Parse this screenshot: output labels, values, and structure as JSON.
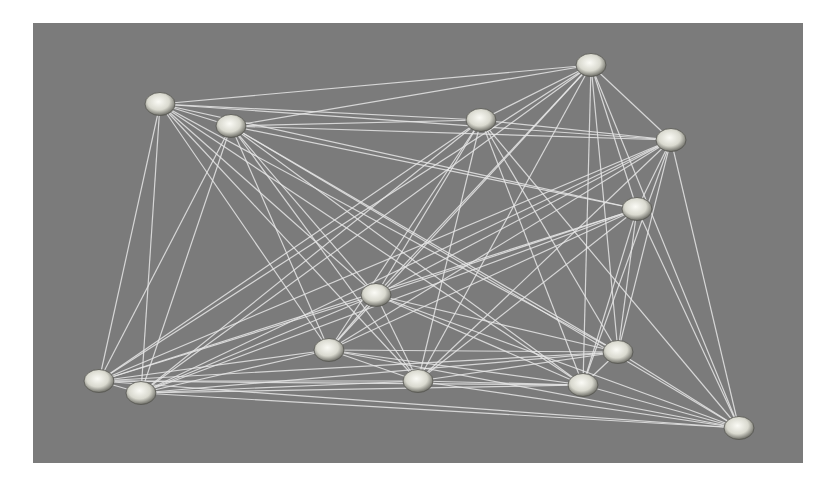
{
  "graph": {
    "type": "network",
    "background_color": "#7b7b7b",
    "edge_color": "#e6e6e6",
    "node_color": "#e8e8e0",
    "nodes": [
      {
        "id": "A",
        "x": 160,
        "y": 104
      },
      {
        "id": "B",
        "x": 231,
        "y": 126
      },
      {
        "id": "C",
        "x": 481,
        "y": 120
      },
      {
        "id": "D",
        "x": 591,
        "y": 65
      },
      {
        "id": "E",
        "x": 671,
        "y": 140
      },
      {
        "id": "F",
        "x": 637,
        "y": 209
      },
      {
        "id": "G",
        "x": 376,
        "y": 295
      },
      {
        "id": "H",
        "x": 329,
        "y": 350
      },
      {
        "id": "I",
        "x": 99,
        "y": 381
      },
      {
        "id": "J",
        "x": 141,
        "y": 393
      },
      {
        "id": "K",
        "x": 418,
        "y": 381
      },
      {
        "id": "L",
        "x": 583,
        "y": 385
      },
      {
        "id": "M",
        "x": 618,
        "y": 352
      },
      {
        "id": "N",
        "x": 739,
        "y": 428
      }
    ],
    "edges": [
      [
        "A",
        "B"
      ],
      [
        "A",
        "C"
      ],
      [
        "A",
        "D"
      ],
      [
        "A",
        "E"
      ],
      [
        "A",
        "F"
      ],
      [
        "A",
        "G"
      ],
      [
        "A",
        "H"
      ],
      [
        "A",
        "I"
      ],
      [
        "A",
        "J"
      ],
      [
        "A",
        "K"
      ],
      [
        "A",
        "L"
      ],
      [
        "A",
        "M"
      ],
      [
        "B",
        "C"
      ],
      [
        "B",
        "D"
      ],
      [
        "B",
        "E"
      ],
      [
        "B",
        "F"
      ],
      [
        "B",
        "G"
      ],
      [
        "B",
        "H"
      ],
      [
        "B",
        "I"
      ],
      [
        "B",
        "J"
      ],
      [
        "B",
        "K"
      ],
      [
        "B",
        "L"
      ],
      [
        "B",
        "M"
      ],
      [
        "B",
        "N"
      ],
      [
        "C",
        "D"
      ],
      [
        "C",
        "E"
      ],
      [
        "C",
        "G"
      ],
      [
        "C",
        "H"
      ],
      [
        "C",
        "I"
      ],
      [
        "C",
        "J"
      ],
      [
        "C",
        "K"
      ],
      [
        "C",
        "L"
      ],
      [
        "C",
        "M"
      ],
      [
        "C",
        "N"
      ],
      [
        "D",
        "E"
      ],
      [
        "D",
        "F"
      ],
      [
        "D",
        "G"
      ],
      [
        "D",
        "H"
      ],
      [
        "D",
        "I"
      ],
      [
        "D",
        "J"
      ],
      [
        "D",
        "K"
      ],
      [
        "D",
        "L"
      ],
      [
        "D",
        "M"
      ],
      [
        "D",
        "N"
      ],
      [
        "E",
        "F"
      ],
      [
        "E",
        "G"
      ],
      [
        "E",
        "H"
      ],
      [
        "E",
        "I"
      ],
      [
        "E",
        "J"
      ],
      [
        "E",
        "K"
      ],
      [
        "E",
        "L"
      ],
      [
        "E",
        "M"
      ],
      [
        "E",
        "N"
      ],
      [
        "F",
        "G"
      ],
      [
        "F",
        "H"
      ],
      [
        "F",
        "I"
      ],
      [
        "F",
        "J"
      ],
      [
        "F",
        "K"
      ],
      [
        "F",
        "L"
      ],
      [
        "F",
        "M"
      ],
      [
        "F",
        "N"
      ],
      [
        "G",
        "H"
      ],
      [
        "G",
        "I"
      ],
      [
        "G",
        "J"
      ],
      [
        "G",
        "K"
      ],
      [
        "G",
        "L"
      ],
      [
        "G",
        "M"
      ],
      [
        "G",
        "N"
      ],
      [
        "H",
        "I"
      ],
      [
        "H",
        "J"
      ],
      [
        "H",
        "K"
      ],
      [
        "H",
        "L"
      ],
      [
        "H",
        "M"
      ],
      [
        "H",
        "N"
      ],
      [
        "I",
        "J"
      ],
      [
        "I",
        "K"
      ],
      [
        "I",
        "L"
      ],
      [
        "I",
        "M"
      ],
      [
        "I",
        "N"
      ],
      [
        "J",
        "K"
      ],
      [
        "J",
        "L"
      ],
      [
        "J",
        "M"
      ],
      [
        "J",
        "N"
      ],
      [
        "K",
        "L"
      ],
      [
        "K",
        "M"
      ],
      [
        "K",
        "N"
      ],
      [
        "L",
        "M"
      ],
      [
        "L",
        "N"
      ],
      [
        "M",
        "N"
      ]
    ]
  }
}
